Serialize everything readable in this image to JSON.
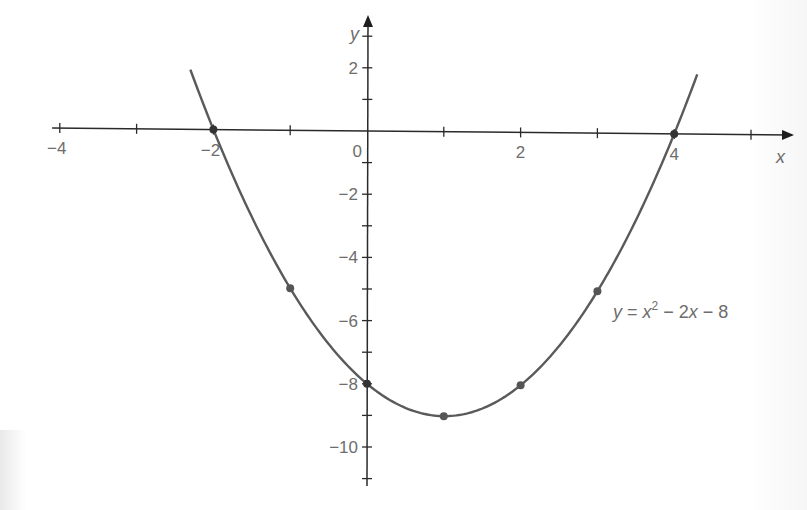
{
  "chart_data": {
    "type": "line",
    "title": "",
    "xlabel": "x",
    "ylabel": "y",
    "equation": "y = x² − 2x − 8",
    "equation_parts": {
      "y": "y",
      "eq": " = ",
      "x1": "x",
      "sup": "2",
      "mid": " − 2",
      "x2": "x",
      "tail": " − 8"
    },
    "xlim": [
      -4,
      5.5
    ],
    "ylim": [
      -11.5,
      3.5
    ],
    "x_ticks": [
      -4,
      -3,
      -2,
      -1,
      0,
      1,
      2,
      3,
      4,
      5
    ],
    "x_tick_labels": [
      {
        "value": -4,
        "label": "−4"
      },
      {
        "value": -2,
        "label": "−2"
      },
      {
        "value": 0,
        "label": "0"
      },
      {
        "value": 2,
        "label": "2"
      },
      {
        "value": 4,
        "label": "4"
      }
    ],
    "y_ticks": [
      3,
      2,
      1,
      -1,
      -2,
      -3,
      -4,
      -5,
      -6,
      -7,
      -8,
      -9,
      -10,
      -11
    ],
    "y_tick_labels": [
      {
        "value": 2,
        "label": "2"
      },
      {
        "value": -2,
        "label": "−2"
      },
      {
        "value": -4,
        "label": "−4"
      },
      {
        "value": -6,
        "label": "−6"
      },
      {
        "value": -8,
        "label": "−8"
      },
      {
        "value": -10,
        "label": "−10"
      }
    ],
    "series": [
      {
        "name": "y = x² − 2x − 8",
        "function": "x^2 - 2x - 8",
        "x_range": [
          -2.3,
          4.3
        ],
        "points": [
          {
            "x": -2,
            "y": 0
          },
          {
            "x": -1,
            "y": -5
          },
          {
            "x": 0,
            "y": -8
          },
          {
            "x": 1,
            "y": -9
          },
          {
            "x": 2,
            "y": -8
          },
          {
            "x": 3,
            "y": -5
          },
          {
            "x": 4,
            "y": 0
          }
        ]
      }
    ],
    "grid": false,
    "legend": "none",
    "colors": {
      "curve": "#5a5a5a",
      "axis": "#2a2a2a",
      "points": "#555555",
      "labels": "#6d6d6d"
    }
  }
}
